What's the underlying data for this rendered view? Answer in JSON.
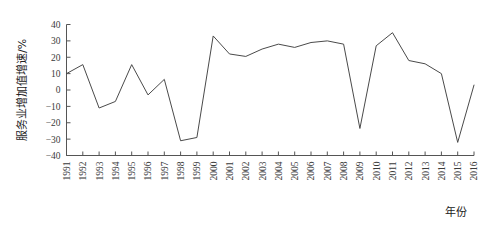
{
  "chart_data": {
    "type": "line",
    "title": "",
    "subtitle": "",
    "xlabel": "年份",
    "ylabel": "服务业增加值增速/%",
    "x": [
      1991,
      1992,
      1993,
      1994,
      1995,
      1996,
      1997,
      1998,
      1999,
      2000,
      2001,
      2002,
      2003,
      2004,
      2005,
      2006,
      2007,
      2008,
      2009,
      2010,
      2011,
      2012,
      2013,
      2014,
      2015,
      2016
    ],
    "categories": [
      "1991",
      "1992",
      "1993",
      "1994",
      "1995",
      "1996",
      "1997",
      "1998",
      "1999",
      "2000",
      "2001",
      "2002",
      "2003",
      "2004",
      "2005",
      "2006",
      "2007",
      "2008",
      "2009",
      "2010",
      "2011",
      "2012",
      "2013",
      "2014",
      "2015",
      "2016"
    ],
    "values": [
      10,
      15.5,
      -11,
      -7,
      15.5,
      -3,
      6.5,
      -31,
      -29,
      33,
      22,
      20.5,
      25,
      28,
      26,
      29,
      30,
      28,
      -23.5,
      27,
      35,
      18,
      16,
      10,
      -32,
      3
    ],
    "series": [
      {
        "name": "服务业增加值增速",
        "values": [
          10,
          15.5,
          -11,
          -7,
          15.5,
          -3,
          6.5,
          -31,
          -29,
          33,
          22,
          20.5,
          25,
          28,
          26,
          29,
          30,
          28,
          -23.5,
          27,
          35,
          18,
          16,
          10,
          -32,
          3
        ]
      }
    ],
    "ylim": [
      -40,
      40
    ],
    "xlim": [
      1991,
      2016
    ],
    "yticks": [
      -40,
      -30,
      -20,
      -10,
      0,
      10,
      20,
      30,
      40
    ],
    "ytick_labels": [
      "-40",
      "-30",
      "-20",
      "-10",
      "0",
      "10",
      "20",
      "30",
      "40"
    ],
    "xticks": [
      1991,
      1992,
      1993,
      1994,
      1995,
      1996,
      1997,
      1998,
      1999,
      2000,
      2001,
      2002,
      2003,
      2004,
      2005,
      2006,
      2007,
      2008,
      2009,
      2010,
      2011,
      2012,
      2013,
      2014,
      2015,
      2016
    ],
    "grid": false,
    "legend": false,
    "legend_position": "none",
    "line_color": "#4a4a4a",
    "axis_color": "#555555",
    "background_color": "#ffffff",
    "xtick_label_rotation": -90,
    "annotations": []
  }
}
